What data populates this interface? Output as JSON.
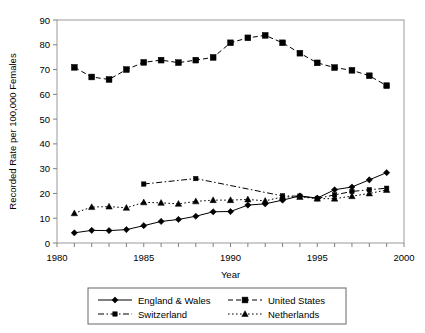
{
  "chart_data": {
    "type": "line",
    "title": "",
    "xlabel": "Year",
    "ylabel": "Recorded Rate per 100,000 Females",
    "xlim": [
      1980,
      2000
    ],
    "ylim": [
      0,
      90
    ],
    "ytick_step": 10,
    "xtick_labels": [
      "1980",
      "1985",
      "1990",
      "1995",
      "2000"
    ],
    "xtick_values": [
      1980,
      1985,
      1990,
      1995,
      2000
    ],
    "xminor_step": 1,
    "ytick_labels": [
      "0",
      "10",
      "20",
      "30",
      "40",
      "50",
      "60",
      "70",
      "80",
      "90"
    ],
    "ytick_values": [
      0,
      10,
      20,
      30,
      40,
      50,
      60,
      70,
      80,
      90
    ],
    "grid": false,
    "legend_position": "bottom",
    "series": [
      {
        "name": "England & Wales",
        "marker": "diamond",
        "dash": "solid",
        "color": "#000000",
        "x": [
          1981,
          1982,
          1983,
          1984,
          1985,
          1986,
          1987,
          1988,
          1989,
          1990,
          1991,
          1992,
          1993,
          1994,
          1995,
          1996,
          1997,
          1998,
          1999
        ],
        "values": [
          4.1,
          5.1,
          5.0,
          5.4,
          7.0,
          8.7,
          9.5,
          10.8,
          12.6,
          12.7,
          15.3,
          15.8,
          17.3,
          19.0,
          18.1,
          21.5,
          22.6,
          25.5,
          28.4
        ]
      },
      {
        "name": "United States",
        "marker": "square",
        "dash": "dashed",
        "color": "#000000",
        "x": [
          1981,
          1982,
          1983,
          1984,
          1985,
          1986,
          1987,
          1988,
          1989,
          1990,
          1991,
          1992,
          1993,
          1994,
          1995,
          1996,
          1997,
          1998,
          1999
        ],
        "values": [
          70.9,
          67.0,
          66.0,
          70.0,
          72.9,
          73.8,
          72.8,
          73.8,
          74.9,
          80.8,
          82.8,
          83.8,
          80.8,
          76.6,
          72.7,
          70.8,
          69.7,
          67.5,
          63.5
        ]
      },
      {
        "name": "Switzerland",
        "marker": "square-small",
        "dash": "dash-dot",
        "color": "#000000",
        "x": [
          1985,
          1988,
          1993,
          1994,
          1995,
          1996,
          1997,
          1998,
          1999
        ],
        "values": [
          23.8,
          26.0,
          19.0,
          18.9,
          18.0,
          19.4,
          20.8,
          21.5,
          22.1
        ]
      },
      {
        "name": "Netherlands",
        "marker": "triangle",
        "dash": "dotted",
        "color": "#000000",
        "x": [
          1981,
          1982,
          1983,
          1984,
          1985,
          1986,
          1987,
          1988,
          1989,
          1990,
          1991,
          1992,
          1993,
          1994,
          1995,
          1996,
          1997,
          1998,
          1999
        ],
        "values": [
          12.0,
          14.5,
          14.7,
          14.2,
          16.4,
          16.2,
          15.8,
          16.8,
          17.3,
          17.3,
          17.6,
          17.0,
          18.6,
          18.6,
          17.9,
          17.9,
          18.9,
          20.0,
          21.4
        ]
      }
    ],
    "legend_entries": [
      {
        "label": "England & Wales",
        "marker": "diamond",
        "dash": "solid"
      },
      {
        "label": "United States",
        "marker": "square",
        "dash": "dashed"
      },
      {
        "label": "Switzerland",
        "marker": "square-small",
        "dash": "dash-dot"
      },
      {
        "label": "Netherlands",
        "marker": "triangle",
        "dash": "dotted"
      }
    ]
  }
}
